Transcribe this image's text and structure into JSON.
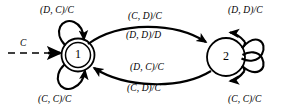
{
  "diagram": {
    "stroke_color": "#000000",
    "background_color": "#ffffff",
    "states": [
      {
        "id": "1",
        "label": "1",
        "shape": "double-circle",
        "is_initial": true,
        "cx": 78,
        "cy": 55,
        "r": 16
      },
      {
        "id": "2",
        "label": "2",
        "shape": "circle",
        "is_initial": false,
        "cx": 226,
        "cy": 57,
        "r": 19
      }
    ],
    "entry": {
      "label": "C",
      "style": "dashed",
      "label_x": 20,
      "label_y": 39
    },
    "transitions": [
      {
        "id": "t-self-1-top",
        "from": "1",
        "to": "1",
        "label": "(D, C)/C",
        "label_x": 40,
        "label_y": 6,
        "position": "top-left"
      },
      {
        "id": "t-self-1-bottom",
        "from": "1",
        "to": "1",
        "label": "(C, C)/C",
        "label_x": 38,
        "label_y": 95,
        "position": "bottom-left"
      },
      {
        "id": "t-1-to-2-a",
        "from": "1",
        "to": "2",
        "label": "(C, D)/C",
        "label_x": 128,
        "label_y": 12,
        "position": "upper-center"
      },
      {
        "id": "t-1-to-2-b",
        "from": "1",
        "to": "2",
        "label": "(D, D)/D",
        "label_x": 126,
        "label_y": 31,
        "position": "center"
      },
      {
        "id": "t-2-to-1-a",
        "from": "2",
        "to": "1",
        "label": "(D, C)/C",
        "label_x": 130,
        "label_y": 63,
        "position": "lower-center"
      },
      {
        "id": "t-2-to-1-b",
        "from": "2",
        "to": "1",
        "label": "(C, D)/C",
        "label_x": 127,
        "label_y": 84,
        "position": "bottom-center"
      },
      {
        "id": "t-self-2-top",
        "from": "2",
        "to": "2",
        "label": "(D, D)/C",
        "label_x": 228,
        "label_y": 6,
        "position": "top-right"
      },
      {
        "id": "t-self-2-bottom",
        "from": "2",
        "to": "2",
        "label": "(C, C)/C",
        "label_x": 228,
        "label_y": 95,
        "position": "bottom-right"
      }
    ]
  }
}
